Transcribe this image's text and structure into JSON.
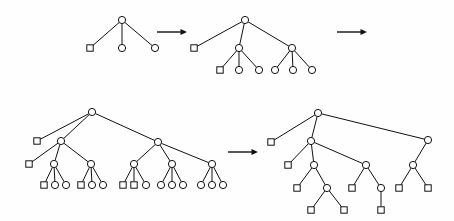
{
  "figure": {
    "background_color": "#fefefe",
    "stroke_color": "#111111",
    "node_fill_color": "#ffffff",
    "node_shapes": {
      "circle": "internal-or-open-node",
      "square": "leaf-or-closed-node"
    },
    "circle_radius": 3.6,
    "square_size": 6.4
  },
  "arrows": [
    {
      "name": "arrow-top-1",
      "x1": 157,
      "y1": 32,
      "x2": 187,
      "y2": 32,
      "direction": "right"
    },
    {
      "name": "arrow-top-2",
      "x1": 337,
      "y1": 32,
      "x2": 367,
      "y2": 32,
      "direction": "right"
    },
    {
      "name": "arrow-bottom-1",
      "x1": 228,
      "y1": 152,
      "x2": 258,
      "y2": 152,
      "direction": "right"
    }
  ],
  "trees": [
    {
      "id": "tree-1",
      "name": "tree-step-1",
      "label": "Step 1",
      "nodes": [
        {
          "id": "t1-root",
          "shape": "circle",
          "x": 122,
          "y": 20
        },
        {
          "id": "t1-a",
          "shape": "square",
          "x": 90,
          "y": 48
        },
        {
          "id": "t1-b",
          "shape": "circle",
          "x": 122,
          "y": 48
        },
        {
          "id": "t1-c",
          "shape": "circle",
          "x": 155,
          "y": 48
        }
      ],
      "edges": [
        [
          "t1-root",
          "t1-a"
        ],
        [
          "t1-root",
          "t1-b"
        ],
        [
          "t1-root",
          "t1-c"
        ]
      ]
    },
    {
      "id": "tree-2",
      "name": "tree-step-2",
      "label": "Step 2",
      "nodes": [
        {
          "id": "t2-root",
          "shape": "circle",
          "x": 245,
          "y": 20
        },
        {
          "id": "t2-a",
          "shape": "square",
          "x": 194,
          "y": 48
        },
        {
          "id": "t2-b",
          "shape": "circle",
          "x": 239,
          "y": 48
        },
        {
          "id": "t2-c",
          "shape": "circle",
          "x": 292,
          "y": 48
        },
        {
          "id": "t2-b1",
          "shape": "square",
          "x": 220,
          "y": 70
        },
        {
          "id": "t2-b2",
          "shape": "circle",
          "x": 239,
          "y": 70
        },
        {
          "id": "t2-b3",
          "shape": "circle",
          "x": 259,
          "y": 70
        },
        {
          "id": "t2-c1",
          "shape": "circle",
          "x": 275,
          "y": 70
        },
        {
          "id": "t2-c2",
          "shape": "circle",
          "x": 293,
          "y": 70
        },
        {
          "id": "t2-c3",
          "shape": "circle",
          "x": 312,
          "y": 70
        }
      ],
      "edges": [
        [
          "t2-root",
          "t2-a"
        ],
        [
          "t2-root",
          "t2-b"
        ],
        [
          "t2-root",
          "t2-c"
        ],
        [
          "t2-b",
          "t2-b1"
        ],
        [
          "t2-b",
          "t2-b2"
        ],
        [
          "t2-b",
          "t2-b3"
        ],
        [
          "t2-c",
          "t2-c1"
        ],
        [
          "t2-c",
          "t2-c2"
        ],
        [
          "t2-c",
          "t2-c3"
        ]
      ]
    },
    {
      "id": "tree-3",
      "name": "tree-step-3",
      "label": "Step 3",
      "nodes": [
        {
          "id": "t3-root",
          "shape": "circle",
          "x": 92,
          "y": 112
        },
        {
          "id": "t3-a",
          "shape": "square",
          "x": 37,
          "y": 141
        },
        {
          "id": "t3-b",
          "shape": "circle",
          "x": 61,
          "y": 141
        },
        {
          "id": "t3-c",
          "shape": "circle",
          "x": 158,
          "y": 142
        },
        {
          "id": "t3-b0",
          "shape": "square",
          "x": 29,
          "y": 164
        },
        {
          "id": "t3-b1",
          "shape": "circle",
          "x": 54,
          "y": 164
        },
        {
          "id": "t3-b2",
          "shape": "circle",
          "x": 91,
          "y": 164
        },
        {
          "id": "t3-c1",
          "shape": "circle",
          "x": 134,
          "y": 164
        },
        {
          "id": "t3-c2",
          "shape": "circle",
          "x": 172,
          "y": 164
        },
        {
          "id": "t3-c3",
          "shape": "circle",
          "x": 212,
          "y": 164
        },
        {
          "id": "t3-b1a",
          "shape": "square",
          "x": 44,
          "y": 185
        },
        {
          "id": "t3-b1b",
          "shape": "circle",
          "x": 55,
          "y": 185
        },
        {
          "id": "t3-b1c",
          "shape": "circle",
          "x": 66,
          "y": 185
        },
        {
          "id": "t3-b2a",
          "shape": "square",
          "x": 81,
          "y": 185
        },
        {
          "id": "t3-b2b",
          "shape": "circle",
          "x": 92,
          "y": 185
        },
        {
          "id": "t3-b2c",
          "shape": "circle",
          "x": 103,
          "y": 185
        },
        {
          "id": "t3-c1a",
          "shape": "square",
          "x": 123,
          "y": 185
        },
        {
          "id": "t3-c1b",
          "shape": "square",
          "x": 134,
          "y": 185
        },
        {
          "id": "t3-c1c",
          "shape": "circle",
          "x": 146,
          "y": 185
        },
        {
          "id": "t3-c2a",
          "shape": "circle",
          "x": 161,
          "y": 185
        },
        {
          "id": "t3-c2b",
          "shape": "circle",
          "x": 172,
          "y": 185
        },
        {
          "id": "t3-c2c",
          "shape": "circle",
          "x": 183,
          "y": 185
        },
        {
          "id": "t3-c3a",
          "shape": "circle",
          "x": 201,
          "y": 185
        },
        {
          "id": "t3-c3b",
          "shape": "circle",
          "x": 212,
          "y": 185
        },
        {
          "id": "t3-c3c",
          "shape": "circle",
          "x": 223,
          "y": 185
        }
      ],
      "edges": [
        [
          "t3-root",
          "t3-a"
        ],
        [
          "t3-root",
          "t3-b"
        ],
        [
          "t3-root",
          "t3-c"
        ],
        [
          "t3-b",
          "t3-b0"
        ],
        [
          "t3-b",
          "t3-b1"
        ],
        [
          "t3-b",
          "t3-b2"
        ],
        [
          "t3-c",
          "t3-c1"
        ],
        [
          "t3-c",
          "t3-c2"
        ],
        [
          "t3-c",
          "t3-c3"
        ],
        [
          "t3-b1",
          "t3-b1a"
        ],
        [
          "t3-b1",
          "t3-b1b"
        ],
        [
          "t3-b1",
          "t3-b1c"
        ],
        [
          "t3-b2",
          "t3-b2a"
        ],
        [
          "t3-b2",
          "t3-b2b"
        ],
        [
          "t3-b2",
          "t3-b2c"
        ],
        [
          "t3-c1",
          "t3-c1a"
        ],
        [
          "t3-c1",
          "t3-c1b"
        ],
        [
          "t3-c1",
          "t3-c1c"
        ],
        [
          "t3-c2",
          "t3-c2a"
        ],
        [
          "t3-c2",
          "t3-c2b"
        ],
        [
          "t3-c2",
          "t3-c2c"
        ],
        [
          "t3-c3",
          "t3-c3a"
        ],
        [
          "t3-c3",
          "t3-c3b"
        ],
        [
          "t3-c3",
          "t3-c3c"
        ]
      ]
    },
    {
      "id": "tree-4",
      "name": "tree-step-4",
      "label": "Step 4",
      "nodes": [
        {
          "id": "t4-root",
          "shape": "circle",
          "x": 318,
          "y": 113
        },
        {
          "id": "t4-a",
          "shape": "square",
          "x": 271,
          "y": 142
        },
        {
          "id": "t4-b",
          "shape": "circle",
          "x": 311,
          "y": 141
        },
        {
          "id": "t4-c",
          "shape": "circle",
          "x": 428,
          "y": 140
        },
        {
          "id": "t4-b0",
          "shape": "square",
          "x": 288,
          "y": 165
        },
        {
          "id": "t4-b1",
          "shape": "circle",
          "x": 314,
          "y": 165
        },
        {
          "id": "t4-b2",
          "shape": "circle",
          "x": 366,
          "y": 165
        },
        {
          "id": "t4-c1",
          "shape": "circle",
          "x": 413,
          "y": 165
        },
        {
          "id": "t4-b1a",
          "shape": "square",
          "x": 297,
          "y": 188
        },
        {
          "id": "t4-b1b",
          "shape": "circle",
          "x": 327,
          "y": 188
        },
        {
          "id": "t4-b2a",
          "shape": "square",
          "x": 352,
          "y": 188
        },
        {
          "id": "t4-b2b",
          "shape": "circle",
          "x": 381,
          "y": 188
        },
        {
          "id": "t4-c1a",
          "shape": "square",
          "x": 399,
          "y": 188
        },
        {
          "id": "t4-c1b",
          "shape": "square",
          "x": 428,
          "y": 188
        },
        {
          "id": "t4-b1ba",
          "shape": "square",
          "x": 311,
          "y": 210
        },
        {
          "id": "t4-b1bb",
          "shape": "square",
          "x": 344,
          "y": 210
        },
        {
          "id": "t4-b2ba",
          "shape": "square",
          "x": 381,
          "y": 210
        }
      ],
      "edges": [
        [
          "t4-root",
          "t4-a"
        ],
        [
          "t4-root",
          "t4-b"
        ],
        [
          "t4-root",
          "t4-c"
        ],
        [
          "t4-b",
          "t4-b0"
        ],
        [
          "t4-b",
          "t4-b1"
        ],
        [
          "t4-b",
          "t4-b2"
        ],
        [
          "t4-c",
          "t4-c1"
        ],
        [
          "t4-b1",
          "t4-b1a"
        ],
        [
          "t4-b1",
          "t4-b1b"
        ],
        [
          "t4-b2",
          "t4-b2a"
        ],
        [
          "t4-b2",
          "t4-b2b"
        ],
        [
          "t4-c1",
          "t4-c1a"
        ],
        [
          "t4-c1",
          "t4-c1b"
        ],
        [
          "t4-b1b",
          "t4-b1ba"
        ],
        [
          "t4-b1b",
          "t4-b1bb"
        ],
        [
          "t4-b2b",
          "t4-b2ba"
        ]
      ]
    }
  ]
}
